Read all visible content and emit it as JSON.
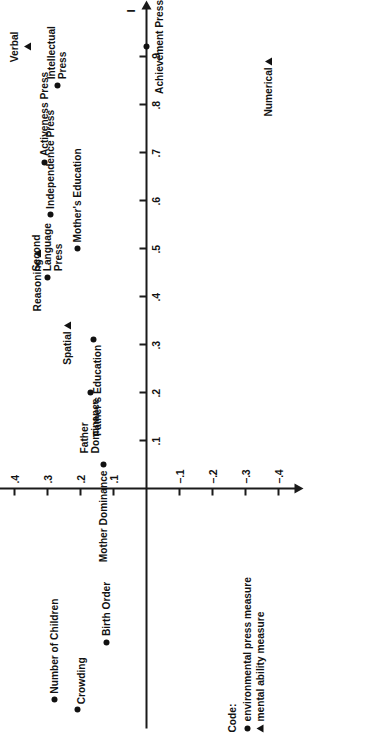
{
  "figure": {
    "orientation_note": "rotated",
    "legend": {
      "title": "Code:",
      "entries": [
        {
          "glyph": "filled-circle-icon",
          "label": "environmental press measure"
        },
        {
          "glyph": "filled-triangle-icon",
          "label": "mental ability measure"
        }
      ]
    }
  },
  "chart_data": {
    "type": "scatter",
    "title": "",
    "xlabel": "I",
    "ylabel": "II",
    "xlim": [
      0.0,
      1.0
    ],
    "ylim": [
      -0.45,
      0.65
    ],
    "grid": false,
    "legend_position": "bottom-left",
    "xticks": [
      ".1",
      ".2",
      ".3",
      ".4",
      ".5",
      ".6",
      ".7",
      ".8",
      ".9"
    ],
    "xtick_values": [
      0.1,
      0.2,
      0.3,
      0.4,
      0.5,
      0.6,
      0.7,
      0.8,
      0.9
    ],
    "yticks": [
      ".6",
      ".5",
      ".4",
      ".3",
      ".2",
      ".1",
      "–.1",
      "–.2",
      "–.3",
      "–.4"
    ],
    "ytick_values": [
      0.6,
      0.5,
      0.4,
      0.3,
      0.2,
      0.1,
      -0.1,
      -0.2,
      -0.3,
      -0.4
    ],
    "series": [
      {
        "name": "environmental press measure",
        "marker": "circle",
        "points": [
          {
            "label": "Achievement Press",
            "x": 0.92,
            "y": 0.0,
            "label_pos": "below"
          },
          {
            "label": "Intellectual\nPress",
            "x": 0.84,
            "y": 0.27,
            "label_pos": "right"
          },
          {
            "label": "English Press",
            "x": 0.63,
            "y": 0.6,
            "label_pos": "right"
          },
          {
            "label": "Father's Occupation",
            "x": 0.6,
            "y": 0.46,
            "label_pos": "right"
          },
          {
            "label": "Activeness Press",
            "x": 0.68,
            "y": 0.31,
            "label_pos": "right"
          },
          {
            "label": "Independence Press",
            "x": 0.57,
            "y": 0.29,
            "label_pos": "right"
          },
          {
            "label": "Mother's Education",
            "x": 0.5,
            "y": 0.21,
            "label_pos": "right"
          },
          {
            "label": "Second\nLanguage\nPress",
            "x": 0.44,
            "y": 0.3,
            "label_pos": "right"
          },
          {
            "label": "Father's Education",
            "x": 0.31,
            "y": 0.16,
            "label_pos": "left-below"
          },
          {
            "label": "Father\nDominance",
            "x": 0.2,
            "y": 0.17,
            "label_pos": "left"
          },
          {
            "label": "Mother Dominance",
            "x": 0.05,
            "y": 0.13,
            "label_pos": "left"
          },
          {
            "label": "Birth Order",
            "x": -0.32,
            "y": 0.12,
            "label_pos": "right"
          },
          {
            "label": "Number of Children",
            "x": -0.44,
            "y": 0.28,
            "label_pos": "right"
          },
          {
            "label": "Crowding",
            "x": -0.46,
            "y": 0.21,
            "label_pos": "right-below"
          }
        ]
      },
      {
        "name": "mental ability measure",
        "marker": "triangle",
        "points": [
          {
            "label": "Verbal",
            "x": 0.92,
            "y": 0.36,
            "label_pos": "above"
          },
          {
            "label": "Numerical",
            "x": 0.89,
            "y": -0.37,
            "label_pos": "left"
          },
          {
            "label": "Reasoning",
            "x": 0.49,
            "y": 0.33,
            "label_pos": "left"
          },
          {
            "label": "Spatial",
            "x": 0.34,
            "y": 0.24,
            "label_pos": "left"
          }
        ]
      }
    ]
  }
}
